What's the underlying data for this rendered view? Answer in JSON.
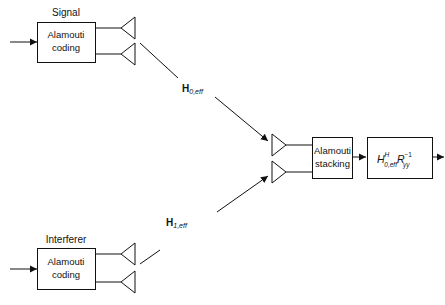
{
  "diagram": {
    "transmitters": [
      {
        "label": "Signal",
        "block": [
          "Alamouti",
          "coding"
        ]
      },
      {
        "label": "Interferer",
        "block": [
          "Alamouti",
          "coding"
        ]
      }
    ],
    "channels": [
      {
        "main": "H",
        "sub": "0,eff"
      },
      {
        "main": "H",
        "sub": "1,eff"
      }
    ],
    "receiver": {
      "stacking_block": [
        "Alamouti",
        "stacking"
      ],
      "filter_block": {
        "h": "H",
        "h_sup": "H",
        "h_sub": "0,eff",
        "r": "R",
        "r_sup": "−1",
        "r_sub": "yy"
      }
    },
    "colors": {
      "stroke": "#111111",
      "background": "#ffffff"
    }
  }
}
